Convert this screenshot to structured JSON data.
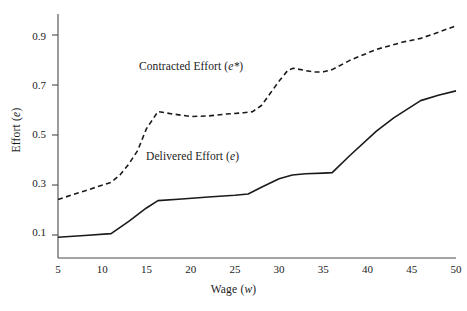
{
  "chart_data": {
    "type": "line",
    "title": "",
    "xlabel": "Wage (w)",
    "ylabel": "Effort (e)",
    "xlabel_plain": "Wage",
    "xlabel_var": "w",
    "ylabel_plain": "Effort",
    "ylabel_var": "e",
    "xlim": [
      5,
      50
    ],
    "ylim": [
      0.0,
      1.0
    ],
    "xticks": [
      5,
      10,
      15,
      20,
      25,
      30,
      35,
      40,
      45,
      50
    ],
    "xtick_labels": [
      "5",
      "10",
      "15",
      "20",
      "25",
      "30",
      "35",
      "40",
      "45",
      "50"
    ],
    "yticks": [
      0.1,
      0.3,
      0.5,
      0.7,
      0.9
    ],
    "ytick_labels": [
      "0.1",
      "0.3",
      "0.5",
      "0.7",
      "0.9"
    ],
    "grid": false,
    "legend_position": "inline-annotations",
    "line_color": "#1a1a1a",
    "series": [
      {
        "name": "Contracted Effort (e*)",
        "name_plain": "Contracted Effort",
        "name_var": "e*",
        "style": "dashed",
        "color": "#1a1a1a",
        "x": [
          5,
          8,
          11,
          12,
          13,
          14,
          15,
          16.3,
          18,
          20,
          22,
          24,
          26,
          27,
          28,
          29,
          30,
          31,
          31.6,
          33,
          34,
          35,
          36,
          38,
          41,
          44,
          46,
          48,
          50
        ],
        "y": [
          0.24,
          0.275,
          0.31,
          0.34,
          0.385,
          0.44,
          0.53,
          0.6,
          0.59,
          0.58,
          0.582,
          0.59,
          0.595,
          0.6,
          0.625,
          0.675,
          0.725,
          0.77,
          0.778,
          0.768,
          0.762,
          0.763,
          0.772,
          0.81,
          0.855,
          0.885,
          0.9,
          0.925,
          0.952
        ]
      },
      {
        "name": "Delivered Effort (e)",
        "name_plain": "Delivered Effort",
        "name_var": "e",
        "style": "solid",
        "color": "#1a1a1a",
        "x": [
          5,
          8,
          11,
          13,
          15,
          16.3,
          19,
          22,
          25,
          26.5,
          28,
          30,
          31.5,
          33,
          35,
          36,
          38,
          41,
          43,
          46,
          48,
          50
        ],
        "y": [
          0.085,
          0.092,
          0.1,
          0.15,
          0.205,
          0.235,
          0.242,
          0.25,
          0.257,
          0.262,
          0.29,
          0.325,
          0.34,
          0.345,
          0.348,
          0.35,
          0.42,
          0.52,
          0.575,
          0.645,
          0.667,
          0.685
        ]
      }
    ],
    "annotations": [
      {
        "text": "Contracted Effort (e*)",
        "text_plain": "Contracted Effort",
        "text_var": "e*",
        "x_px": 139,
        "y_px": 60
      },
      {
        "text": "Delivered Effort (e)",
        "text_plain": "Delivered Effort",
        "text_var": "e",
        "x_px": 146,
        "y_px": 150
      }
    ]
  },
  "axes": {
    "left_px": 58,
    "right_px": 456,
    "top_px": 14,
    "bottom_px": 258,
    "x_min": 5,
    "x_max": 50,
    "y_min": 0.0,
    "y_max": 1.0,
    "x_px_per_unit": 8.578,
    "y_px_per_unit": 250
  }
}
